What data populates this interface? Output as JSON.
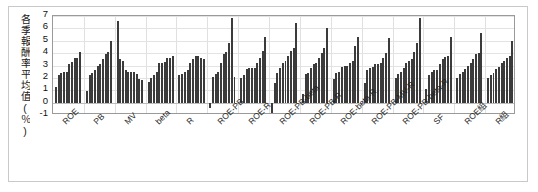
{
  "chart_data": {
    "type": "bar",
    "title": "",
    "xlabel": "",
    "ylabel": "各季報酬率平均值(％)",
    "ylim": [
      -1,
      7
    ],
    "yticks": [
      7,
      6,
      5,
      4,
      3,
      2,
      1,
      0,
      -1
    ],
    "ytick_labels": [
      "7",
      "6",
      "5",
      "4",
      "3",
      "2",
      "1",
      "0",
      "-1"
    ],
    "grid": true,
    "legend": "none",
    "bar_color": "#3b3b3b",
    "categories": [
      "ROE",
      "PB",
      "MV",
      "beta",
      "R",
      "ROE-PB",
      "ROE-R",
      "ROE-PB-beta",
      "ROE-PB-R",
      "ROE-beta-R",
      "ROE-PB-MV-R",
      "ROE-PB-beta-R",
      "SF",
      "ROE組",
      "R組"
    ],
    "bars_per_group": 10,
    "groups": [
      {
        "name": "ROE",
        "values": [
          1.3,
          2.2,
          2.4,
          2.5,
          2.5,
          3.1,
          3.3,
          3.6,
          3.6,
          4.1
        ]
      },
      {
        "name": "PB",
        "values": [
          0.9,
          2.2,
          2.4,
          2.6,
          3.0,
          3.1,
          3.5,
          3.9,
          4.1,
          5.0
        ]
      },
      {
        "name": "MV",
        "values": [
          6.6,
          3.5,
          3.4,
          2.6,
          2.5,
          2.5,
          2.5,
          2.3,
          1.9,
          1.8
        ]
      },
      {
        "name": "beta",
        "values": [
          1.7,
          2.0,
          2.2,
          2.5,
          3.2,
          3.2,
          3.3,
          3.6,
          3.6,
          3.8
        ]
      },
      {
        "name": "R",
        "values": [
          2.2,
          2.3,
          2.5,
          2.6,
          3.2,
          3.5,
          3.8,
          3.8,
          3.6,
          3.5
        ]
      },
      {
        "name": "ROE-PB",
        "values": [
          -0.4,
          2.1,
          2.3,
          2.5,
          3.2,
          3.9,
          4.1,
          4.8,
          6.8,
          2.1
        ]
      },
      {
        "name": "ROE-R",
        "values": [
          2.0,
          2.2,
          2.7,
          2.8,
          2.8,
          2.8,
          3.2,
          3.6,
          4.2,
          5.3
        ]
      },
      {
        "name": "ROE-PB-beta",
        "values": [
          -0.9,
          1.6,
          2.4,
          2.8,
          3.2,
          3.4,
          3.8,
          4.2,
          4.4,
          6.4
        ]
      },
      {
        "name": "ROE-PB-R",
        "values": [
          0.7,
          2.3,
          2.4,
          2.8,
          3.1,
          3.2,
          3.6,
          4.0,
          4.4,
          6.0
        ]
      },
      {
        "name": "ROE-beta-R",
        "values": [
          1.9,
          2.4,
          2.5,
          2.9,
          3.0,
          3.0,
          3.2,
          3.4,
          4.6,
          5.3
        ]
      },
      {
        "name": "ROE-PB-MV-R",
        "values": [
          1.6,
          2.6,
          2.8,
          2.9,
          3.1,
          3.1,
          3.2,
          3.6,
          4.0,
          5.2
        ]
      },
      {
        "name": "ROE-PB-beta-R",
        "values": [
          2.0,
          2.3,
          2.5,
          2.8,
          3.2,
          3.4,
          3.5,
          4.1,
          4.8,
          6.8
        ]
      },
      {
        "name": "SF",
        "values": [
          1.1,
          2.2,
          2.5,
          2.6,
          2.6,
          3.1,
          3.5,
          3.7,
          3.8,
          5.3
        ]
      },
      {
        "name": "ROE組",
        "values": [
          2.0,
          2.3,
          2.5,
          2.7,
          3.0,
          3.2,
          3.5,
          3.9,
          4.0,
          5.6
        ]
      },
      {
        "name": "R組",
        "values": [
          2.0,
          2.2,
          2.4,
          2.7,
          2.9,
          3.2,
          3.4,
          3.6,
          3.8,
          5.0
        ]
      }
    ]
  }
}
